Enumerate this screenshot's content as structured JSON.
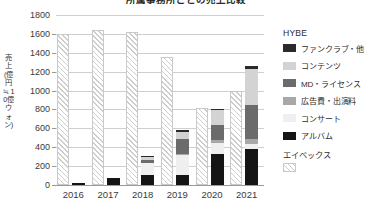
{
  "chart_data": {
    "type": "bar",
    "title": "所属事務所ごとの売上比較",
    "xlabel": "",
    "ylabel": "売上(億円 ≒ 10億ウォン)",
    "ylim": [
      0,
      1800
    ],
    "yticks": [
      0,
      200,
      400,
      600,
      800,
      1000,
      1200,
      1400,
      1600,
      1800
    ],
    "grid": true,
    "legend_position": "right",
    "categories": [
      "2016",
      "2017",
      "2018",
      "2019",
      "2020",
      "2021"
    ],
    "companies": [
      {
        "name": "エイベックス",
        "style": "hatched",
        "values": [
          1600,
          1640,
          1620,
          1360,
          820,
          1000
        ]
      },
      {
        "name": "HYBE",
        "style": "stacked",
        "series": [
          {
            "name": "アルバム",
            "color": "#151515",
            "values": [
              20,
              78,
              108,
              110,
              325,
              382
            ]
          },
          {
            "name": "コンサート",
            "color": "#efefef",
            "values": [
              0,
              0,
              122,
              205,
              120,
              48
            ]
          },
          {
            "name": "広告費・出演料",
            "color": "#a8a8a8",
            "values": [
              0,
              0,
              0,
              18,
              35,
              58
            ]
          },
          {
            "name": "MD・ライセンス",
            "color": "#6b6b6b",
            "values": [
              0,
              0,
              40,
              153,
              152,
              355
            ]
          },
          {
            "name": "コンテンツ",
            "color": "#d3d3d3",
            "values": [
              0,
              0,
              28,
              72,
              160,
              390
            ]
          },
          {
            "name": "ファンクラブ・他",
            "color": "#2a2a2a",
            "values": [
              0,
              0,
              12,
              22,
              18,
              27
            ]
          }
        ]
      }
    ]
  },
  "legend": {
    "group1_title": "HYBE",
    "group1_items": [
      {
        "label": "ファンクラブ・他",
        "color": "#2a2a2a"
      },
      {
        "label": "コンテンツ",
        "color": "#d3d3d3"
      },
      {
        "label": "MD・ライセンス",
        "color": "#6b6b6b"
      },
      {
        "label": "広告費・出演料",
        "color": "#a8a8a8"
      },
      {
        "label": "コンサート",
        "color": "#efefef"
      },
      {
        "label": "アルバム",
        "color": "#151515"
      }
    ],
    "group2_title": "エイベックス"
  }
}
